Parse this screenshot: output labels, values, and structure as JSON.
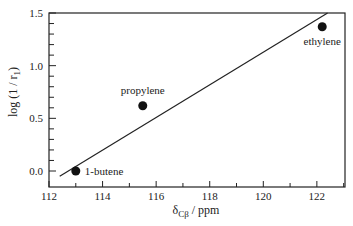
{
  "chart_data": {
    "type": "scatter",
    "title": "",
    "xlabel": "δCβ / ppm",
    "xlabel_main": "δ",
    "xlabel_sub": "Cβ",
    "xlabel_unit": " / ppm",
    "ylabel": "log (1 / r1)",
    "xlim": [
      112,
      123
    ],
    "ylim": [
      -0.1,
      1.5
    ],
    "xticks": [
      112,
      114,
      116,
      118,
      120,
      122
    ],
    "yticks": [
      0.0,
      0.5,
      1.0,
      1.5
    ],
    "xtick_labels": [
      "112",
      "114",
      "116",
      "118",
      "120",
      "122"
    ],
    "ytick_labels": [
      "0.0",
      "0.5",
      "1.0",
      "1.5"
    ],
    "grid": false,
    "legend": null,
    "points": [
      {
        "label": "1-butene",
        "x": 113.0,
        "y": 0.0
      },
      {
        "label": "propylene",
        "x": 115.5,
        "y": 0.62
      },
      {
        "label": "ethylene",
        "x": 122.2,
        "y": 1.37
      }
    ],
    "fit_line": {
      "x": [
        112.4,
        122.4
      ],
      "y": [
        -0.05,
        1.5
      ]
    }
  }
}
